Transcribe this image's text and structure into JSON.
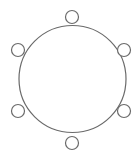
{
  "diagram": {
    "type": "round-table-seating",
    "colors": {
      "stroke": "#6a6a6a",
      "fill": "#ffffff",
      "background": "#ffffff"
    },
    "table": {
      "shape": "circle",
      "cx": 72.5,
      "cy": 79,
      "r": 53.5
    },
    "seats": [
      {
        "id": "seat-top",
        "cx": 72,
        "cy": 17,
        "r": 6.5
      },
      {
        "id": "seat-upper-right",
        "cx": 124,
        "cy": 50,
        "r": 6.5
      },
      {
        "id": "seat-lower-right",
        "cx": 124,
        "cy": 111,
        "r": 6.5
      },
      {
        "id": "seat-bottom",
        "cx": 72,
        "cy": 143,
        "r": 6.5
      },
      {
        "id": "seat-lower-left",
        "cx": 18,
        "cy": 111,
        "r": 6.5
      },
      {
        "id": "seat-upper-left",
        "cx": 18,
        "cy": 50,
        "r": 6.5
      }
    ]
  }
}
